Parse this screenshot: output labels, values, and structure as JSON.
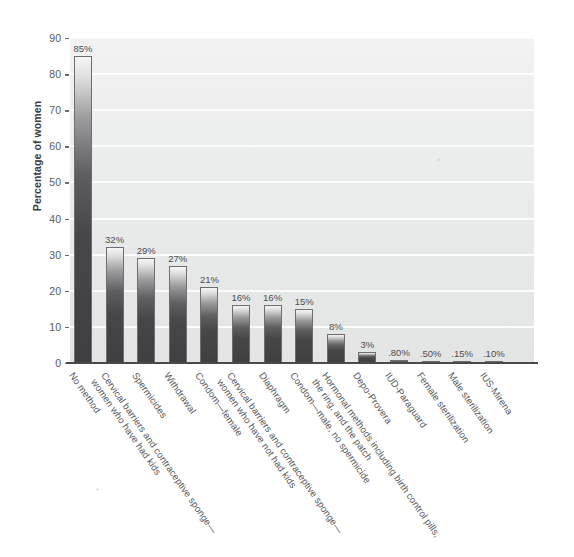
{
  "chart_data": {
    "type": "bar",
    "title": "",
    "xlabel": "",
    "ylabel": "Percentage of women",
    "ylim": [
      0,
      90
    ],
    "grid": true,
    "legend": "none",
    "y_ticks": [
      0,
      10,
      20,
      30,
      40,
      50,
      60,
      70,
      80,
      90
    ],
    "y_tick_labels": [
      "0",
      "10",
      "20",
      "30",
      "40",
      "50",
      "60",
      "70",
      "80",
      "90"
    ],
    "categories": [
      "No method",
      "Cervical barriers and contraceptive sponge— women who have had kids",
      "Spermicides",
      "Withdrawal",
      "Condom—female",
      "Cervical barriers and contraceptive sponge— women who have not had kids",
      "Diaphragm",
      "Condom—male, no spermicide",
      "Hormonal methods including birth control pills, the ring, and the patch",
      "Depo-Provera",
      "IUD-Paraguard",
      "Female sterilization",
      "Male sterilization",
      "IUS-Mirena"
    ],
    "values": [
      85,
      32,
      29,
      27,
      21,
      16,
      16,
      15,
      8,
      3,
      0.8,
      0.5,
      0.15,
      0.1
    ],
    "value_labels": [
      "85%",
      "32%",
      "29%",
      "27%",
      "21%",
      "16%",
      "16%",
      "15%",
      "8%",
      "3%",
      ".80%",
      ".50%",
      ".15%",
      ".10%"
    ]
  },
  "axis": {
    "y_title": "Percentage of women"
  },
  "categories_display": [
    {
      "line1": "No method",
      "line2": ""
    },
    {
      "line1": "Cervical barriers and contraceptive sponge—",
      "line2": "women who have had kids"
    },
    {
      "line1": "Spermicides",
      "line2": ""
    },
    {
      "line1": "Withdrawal",
      "line2": ""
    },
    {
      "line1": "Condom—female",
      "line2": ""
    },
    {
      "line1": "Cervical barriers and contraceptive sponge—",
      "line2": "women who have not had kids"
    },
    {
      "line1": "Diaphragm",
      "line2": ""
    },
    {
      "line1": "Condom—male, no spermicide",
      "line2": ""
    },
    {
      "line1": "Hormonal methods including birth control pills,",
      "line2": "the ring, and the patch"
    },
    {
      "line1": "Depo-Provera",
      "line2": ""
    },
    {
      "line1": "IUD-Paraguard",
      "line2": ""
    },
    {
      "line1": "Female sterilization",
      "line2": ""
    },
    {
      "line1": "Male sterilization",
      "line2": ""
    },
    {
      "line1": "IUS-Mirena",
      "line2": ""
    }
  ],
  "colors": {
    "plot_background": "#ececec",
    "gridline": "#fdfdfd",
    "bar_top": "#f6f6f6",
    "bar_bottom": "#3f3f41",
    "bar_outline": "#6e6e70",
    "axis": "#4a4a4c",
    "text": "#58585a"
  }
}
